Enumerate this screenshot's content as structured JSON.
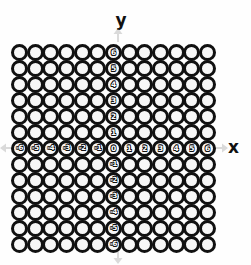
{
  "figure": {
    "type": "coordinate-grid-of-circles",
    "background_color": "#fefefe",
    "ring_color": "#111111",
    "ring_fill_color": "#f7f7f7",
    "label_text_color": "#ffffff",
    "arrow_color": "#9a9a9a"
  },
  "axes": {
    "x_axis_label": "x",
    "y_axis_label": "y",
    "x_axis_label_name": "x-axis-label",
    "y_axis_label_name": "y-axis-label",
    "arrows": {
      "up": "arrow-up",
      "down": "arrow-down",
      "left": "arrow-left",
      "right": "arrow-right"
    }
  },
  "chart_data": {
    "type": "scatter",
    "title": "",
    "subtitle": "",
    "xlabel": "x",
    "ylabel": "y",
    "xlim": [
      -6,
      6
    ],
    "ylim": [
      -6,
      6
    ],
    "grid": true,
    "legend": null,
    "marker": "open-circle",
    "columns": 13,
    "rows": 13,
    "x_tick_labels": [
      "-6",
      "-5",
      "-4",
      "-3",
      "-2",
      "-1",
      "0",
      "1",
      "2",
      "3",
      "4",
      "5",
      "6"
    ],
    "y_tick_labels": [
      "6",
      "5",
      "4",
      "3",
      "2",
      "1",
      "0",
      "-1",
      "-2",
      "-3",
      "-4",
      "-5",
      "-6"
    ],
    "x_tick_values": [
      -6,
      -5,
      -4,
      -3,
      -2,
      -1,
      0,
      1,
      2,
      3,
      4,
      5,
      6
    ],
    "y_tick_values": [
      6,
      5,
      4,
      3,
      2,
      1,
      0,
      -1,
      -2,
      -3,
      -4,
      -5,
      -6
    ],
    "origin_label": "0"
  }
}
